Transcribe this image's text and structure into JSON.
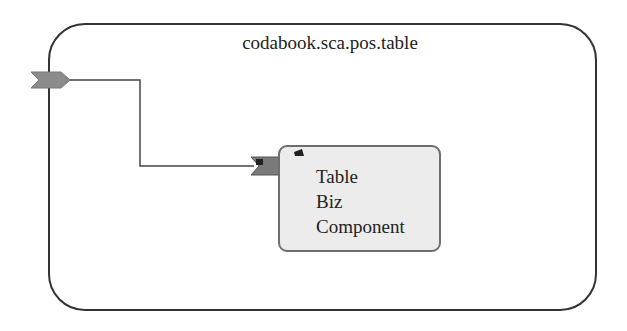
{
  "composite": {
    "name": "codabook.sca.pos.table",
    "border_color": "#333333"
  },
  "promoted_service": {
    "icon": "service-chevron-icon",
    "color": "#8c8c8c"
  },
  "component": {
    "label_lines": [
      "Table",
      "Biz",
      "Component"
    ],
    "fill_color": "#ececec",
    "border_color": "#6e6e6e",
    "service": {
      "icon": "service-chevron-icon",
      "color": "#7a7a7a"
    },
    "implementation_icon": "implementation-marker-icon"
  },
  "wire": {
    "from": "promoted_service",
    "to": "component.service",
    "color": "#444444"
  }
}
